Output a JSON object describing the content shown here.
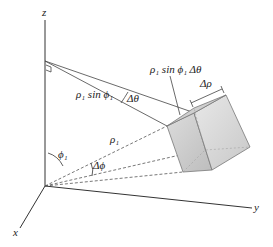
{
  "axes": {
    "z_label": "z",
    "x_label": "x",
    "y_label": "y"
  },
  "labels": {
    "rho_sin_phi": "ρ₁ sin ϕ₁",
    "delta_theta": "Δθ",
    "arc_length": "ρ₁ sin ϕ₁ Δθ",
    "delta_rho": "Δρ",
    "rho": "ρ₁",
    "phi": "ϕ₁",
    "delta_phi": "Δϕ"
  },
  "colors": {
    "line": "#333333",
    "cube_fill_light": "#e2e2e2",
    "cube_fill_dark": "#c4c4c4",
    "cube_edge": "#777777"
  }
}
